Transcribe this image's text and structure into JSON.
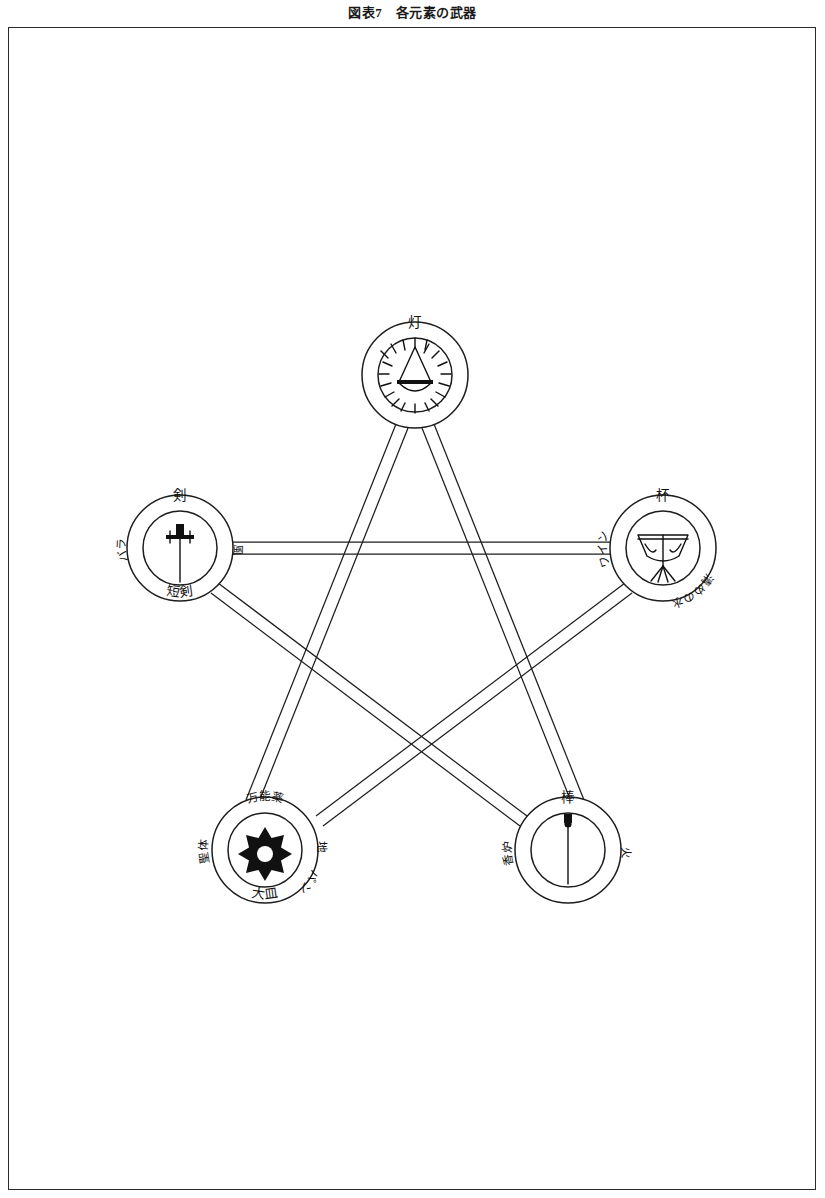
{
  "figure": {
    "title": "図表7　各元素の武器",
    "caption_number": "7",
    "caption_text": "各元素の武器"
  },
  "diagram": {
    "type": "pentagram",
    "node_count": 5,
    "edge_style": "double-line-band",
    "line_color": "#1d1d1d",
    "background": "#ffffff"
  },
  "nodes": [
    {
      "id": "lamp",
      "position": "top",
      "cx": 415,
      "cy": 375,
      "r_outer": 53,
      "r_inner": 37,
      "top_label": "灯",
      "left_label": "",
      "right_label": "",
      "bottom_label": "",
      "icon": "radiant-lamp-icon"
    },
    {
      "id": "sword",
      "position": "upper-left",
      "cx": 180,
      "cy": 548,
      "r_outer": 53,
      "r_inner": 37,
      "top_label": "剣",
      "left_label": "バラ",
      "right_label": "風",
      "bottom_label": "短剣",
      "icon": "sword-icon"
    },
    {
      "id": "cup",
      "position": "upper-right",
      "cx": 663,
      "cy": 548,
      "r_outer": 53,
      "r_inner": 37,
      "top_label": "杯",
      "left_label": "ワイン",
      "right_label": "",
      "bottom_label": "清めの水",
      "icon": "chalice-icon"
    },
    {
      "id": "pentacle",
      "position": "lower-left",
      "cx": 265,
      "cy": 850,
      "r_outer": 53,
      "r_inner": 37,
      "top_label": "万能薬",
      "left_label": "聖体",
      "right_label": "地",
      "right_label_2": "パン",
      "bottom_label": "大皿",
      "icon": "pentacle-star-icon"
    },
    {
      "id": "wand",
      "position": "lower-right",
      "cx": 568,
      "cy": 850,
      "r_outer": 53,
      "r_inner": 37,
      "top_label": "棒",
      "left_label": "香炉",
      "right_label": "火",
      "bottom_label": "",
      "icon": "wand-icon"
    }
  ],
  "edges": [
    {
      "from": "lamp",
      "to": "pentacle"
    },
    {
      "from": "pentacle",
      "to": "cup"
    },
    {
      "from": "cup",
      "to": "sword"
    },
    {
      "from": "sword",
      "to": "wand"
    },
    {
      "from": "wand",
      "to": "lamp"
    }
  ]
}
